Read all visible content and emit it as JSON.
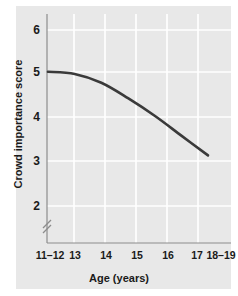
{
  "chart_data": {
    "type": "line",
    "title": "",
    "xlabel": "Age (years)",
    "ylabel": "Crowd importance score",
    "categories": [
      "11–12",
      "13",
      "14",
      "15",
      "16",
      "17",
      "18–19"
    ],
    "values": [
      5.05,
      5.0,
      4.8,
      4.45,
      4.05,
      3.6,
      3.15
    ],
    "series": [
      {
        "name": "Crowd importance score",
        "values": [
          5.05,
          5.0,
          4.8,
          4.45,
          4.05,
          3.6,
          3.15
        ]
      }
    ],
    "ylim": [
      2,
      6
    ],
    "yticks": [
      6,
      5,
      4,
      3,
      2
    ],
    "ytick_labels": [
      "6",
      "5",
      "4",
      "3",
      "2"
    ],
    "xtick_labels": [
      "11–12",
      "13",
      "14",
      "15",
      "16",
      "17",
      "18–19"
    ],
    "grid": true,
    "grid_color": "#ffffff",
    "legend": "none",
    "axis_break": {
      "axis": "y",
      "symbol": "≈",
      "below_tick": 2
    },
    "line_color": "#3a3a3a",
    "panel_color": "#e8e8e8",
    "text_color": "#1a1a1a"
  },
  "figure": {
    "background": "#ffffff"
  }
}
